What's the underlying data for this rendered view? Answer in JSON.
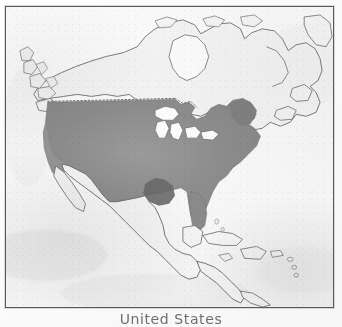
{
  "figure": {
    "caption": "United States",
    "kind": "shaded-relief-locator-map",
    "region": "North America"
  },
  "map": {
    "title": "North America locator map",
    "highlighted_country": "United States",
    "frame": {
      "border_color": "#585858",
      "background_color": "#fcfcfc"
    },
    "colors": {
      "ocean": "#f8f8f8",
      "land_unshaded": "#f2f2f2",
      "land_outline": "#6a6a6a",
      "highlight_fill": "#8d8d8d",
      "highlight_dark": "#6b6b6b",
      "lake_fill": "#fbfbfb",
      "border_dotted": "#707070"
    },
    "features": [
      {
        "name": "United States",
        "shaded": "true",
        "label": "United States"
      },
      {
        "name": "Canada",
        "shaded": "false",
        "label": "Canada"
      },
      {
        "name": "Mexico",
        "shaded": "false",
        "label": "Mexico"
      },
      {
        "name": "Greenland",
        "shaded": "false",
        "label": "Greenland"
      },
      {
        "name": "Cuba",
        "shaded": "false",
        "label": "Cuba"
      },
      {
        "name": "Hispaniola",
        "shaded": "false",
        "label": "Hispaniola"
      },
      {
        "name": "Central America",
        "shaded": "false",
        "label": "Central America"
      },
      {
        "name": "Great Lakes",
        "shaded": "false",
        "label": "Great Lakes"
      },
      {
        "name": "Alaska Panhandle",
        "shaded": "false",
        "label": "Alaska Panhandle"
      },
      {
        "name": "Baja California",
        "shaded": "false",
        "label": "Baja California"
      },
      {
        "name": "Florida Peninsula",
        "shaded": "true",
        "label": "Florida"
      },
      {
        "name": "Nova Scotia",
        "shaded": "false",
        "label": "Nova Scotia"
      }
    ],
    "borders": [
      {
        "name": "United States - Canada border",
        "style": "dotted"
      }
    ]
  }
}
